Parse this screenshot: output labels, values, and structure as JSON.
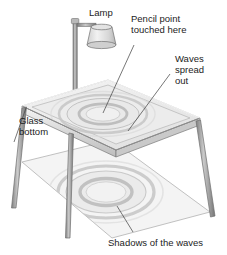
{
  "figure": {
    "background_color": "#ffffff",
    "line_color": "#6e6e6e",
    "text_color": "#1c1c1c"
  },
  "labels": {
    "lamp": "Lamp",
    "pencil_point_line1": "Pencil point",
    "pencil_point_line2": "touched here",
    "waves_line1": "Waves",
    "waves_line2": "spread",
    "waves_line3": "out",
    "glass_line1": "Glass",
    "glass_line2": "bottom",
    "shadows": "Shadows of the waves"
  },
  "parts": {
    "lamp_shade": "lamp-shade",
    "lamp_pole": "lamp-pole",
    "lamp_arm": "lamp-arm",
    "table_top": "glass-table-top",
    "table_rim": "table-rim",
    "leg_front_left": "table-leg-front-left",
    "leg_front_center": "table-leg-front-center",
    "leg_back_center": "table-leg-back-center",
    "leg_right": "table-leg-right",
    "water_waves": "water-wave-rings",
    "floor_plane": "floor-plane",
    "shadow_rings": "shadow-wave-rings"
  },
  "colors": {
    "glass_fill": "#ededed",
    "glass_rim": "#d2d2d2",
    "leg_fill": "#9a9a9a",
    "floor_fill": "#f0f0f0",
    "ring_stroke": "#b0b0b0",
    "shadow_ring": "#bdbdbd",
    "outline": "#7a7a7a"
  }
}
